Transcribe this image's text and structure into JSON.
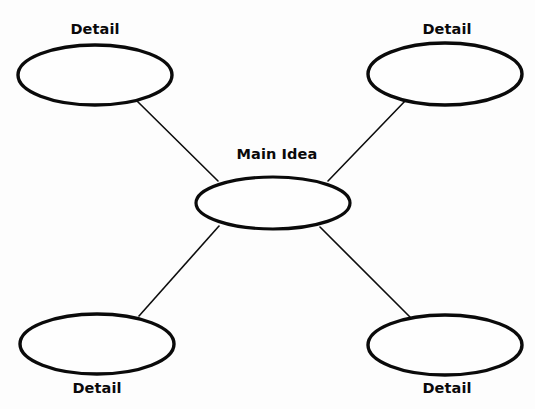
{
  "diagram": {
    "type": "concept-map",
    "background_color": "#fdfdfd",
    "stroke_color": "#0a0a0a",
    "fill_color": "#fefefe",
    "center": {
      "id": "main-idea",
      "label": "Main Idea",
      "cx": 273,
      "cy": 203,
      "rx": 77,
      "ry": 26,
      "stroke_width": 3.2,
      "label_x": 277,
      "label_y": 159,
      "label_position": "above"
    },
    "details": [
      {
        "id": "detail-top-left",
        "label": "Detail",
        "cx": 95,
        "cy": 75,
        "rx": 77,
        "ry": 30,
        "stroke_width": 3.4,
        "label_x": 95,
        "label_y": 34,
        "label_position": "above"
      },
      {
        "id": "detail-top-right",
        "label": "Detail",
        "cx": 445,
        "cy": 74,
        "rx": 77,
        "ry": 31,
        "stroke_width": 3.4,
        "label_x": 447,
        "label_y": 34,
        "label_position": "above"
      },
      {
        "id": "detail-bottom-left",
        "label": "Detail",
        "cx": 97,
        "cy": 344,
        "rx": 77,
        "ry": 30,
        "stroke_width": 3.4,
        "label_x": 97,
        "label_y": 393,
        "label_position": "below"
      },
      {
        "id": "detail-bottom-right",
        "label": "Detail",
        "cx": 445,
        "cy": 345,
        "rx": 77,
        "ry": 30,
        "stroke_width": 3.4,
        "label_x": 447,
        "label_y": 393,
        "label_position": "below"
      }
    ],
    "connectors": [
      {
        "id": "connector-top-left",
        "from": "detail-top-left",
        "to": "main-idea",
        "x1": 136,
        "y1": 100,
        "x2": 218,
        "y2": 181
      },
      {
        "id": "connector-top-right",
        "from": "detail-top-right",
        "to": "main-idea",
        "x1": 406,
        "y1": 100,
        "x2": 328,
        "y2": 181
      },
      {
        "id": "connector-bottom-left",
        "from": "main-idea",
        "to": "detail-bottom-left",
        "x1": 219,
        "y1": 226,
        "x2": 139,
        "y2": 316
      },
      {
        "id": "connector-bottom-right",
        "from": "main-idea",
        "to": "detail-bottom-right",
        "x1": 320,
        "y1": 227,
        "x2": 410,
        "y2": 317
      }
    ]
  }
}
